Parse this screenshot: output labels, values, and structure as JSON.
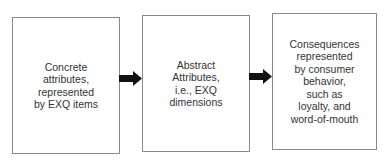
{
  "diagram": {
    "type": "flowchart",
    "boxes": [
      {
        "id": "concrete",
        "label": "Concrete\nattributes,\nrepresented\nby EXQ items"
      },
      {
        "id": "abstract",
        "label": "Abstract\nAttributes,\ni.e., EXQ\ndimensions"
      },
      {
        "id": "consequences",
        "label": "Consequences\nrepresented\nby consumer\nbehavior,\nsuch as\nloyalty, and\nword-of-mouth"
      }
    ],
    "arrows": [
      {
        "from": "concrete",
        "to": "abstract"
      },
      {
        "from": "abstract",
        "to": "consequences"
      }
    ],
    "colors": {
      "border": "#8a8a8a",
      "arrow": "#111111",
      "text": "#333333",
      "background": "#ffffff"
    }
  }
}
